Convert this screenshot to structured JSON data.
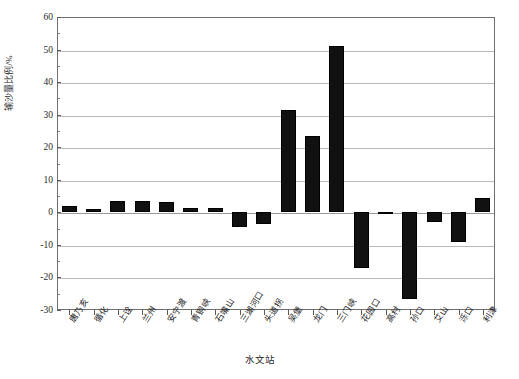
{
  "chart_data": {
    "type": "bar",
    "title": "",
    "subtitle": "",
    "xlabel": "水文站",
    "ylabel": "输沙量比例/%",
    "ylim": [
      -30,
      60
    ],
    "ytick_step": 10,
    "yticks": [
      60,
      50,
      40,
      30,
      20,
      10,
      0,
      -10,
      -20,
      -30
    ],
    "ytick_labels": [
      "60",
      "50",
      "40",
      "30",
      "20",
      "10",
      "0",
      "-10",
      "-20",
      "-30"
    ],
    "grid": true,
    "legend": null,
    "bar_color": "#111111",
    "categories": [
      "唐乃亥",
      "循化",
      "上诠",
      "兰州",
      "安宁渡",
      "青铜峡",
      "石嘴山",
      "三湖河口",
      "头道拐",
      "吴堡",
      "龙门",
      "三门峡",
      "花园口",
      "高村",
      "孙口",
      "艾山",
      "泺口",
      "利津"
    ],
    "values": [
      1.8,
      1.0,
      3.5,
      3.6,
      3.3,
      1.2,
      1.3,
      -4.5,
      -3.5,
      31.5,
      23.5,
      51.0,
      -17.0,
      -0.5,
      -26.5,
      -3.0,
      -9.0,
      4.5
    ]
  },
  "axis": {
    "x_title": "水文站",
    "y_title": "输沙量比例/%"
  }
}
